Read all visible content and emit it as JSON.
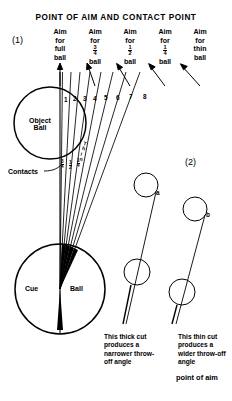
{
  "title": "POINT OF AIM AND CONTACT POINT",
  "figures": {
    "one": "(1)",
    "two": "(2)"
  },
  "aim_columns": [
    {
      "line1": "Aim",
      "line2": "for",
      "line3": "full",
      "num": "",
      "den": "",
      "line4": "ball"
    },
    {
      "line1": "Aim",
      "line2": "for",
      "line3": "",
      "num": "3",
      "den": "4",
      "line4": "ball"
    },
    {
      "line1": "Aim",
      "line2": "for",
      "line3": "",
      "num": "1",
      "den": "2",
      "line4": "ball"
    },
    {
      "line1": "Aim",
      "line2": "for",
      "line3": "",
      "num": "1",
      "den": "4",
      "line4": "ball"
    },
    {
      "line1": "Aim",
      "line2": "for",
      "line3": "thin",
      "num": "",
      "den": "",
      "line4": "ball"
    }
  ],
  "aim_numbers": [
    "1",
    "2",
    "3",
    "4",
    "5",
    "6",
    "7",
    "8"
  ],
  "object_ball": {
    "line1": "Object",
    "line2": "Ball"
  },
  "cue_ball": {
    "left": "Cue",
    "right": "Ball"
  },
  "contacts_label": "Contacts",
  "contact_fractions": [
    {
      "num": "3",
      "den": "4"
    },
    {
      "num": "1",
      "den": "2"
    },
    {
      "num": "1",
      "den": "4"
    }
  ],
  "thin_word": [
    "T",
    "h",
    "i",
    "n"
  ],
  "ball_marks": {
    "a": "a",
    "b": "b"
  },
  "captions": {
    "thick": "This thick cut produces a narrower throw-off angle",
    "thin": "This thin cut produces a wider throw-off angle",
    "point_of_aim": "point of aim"
  },
  "colors": {
    "ink": "#000000",
    "paper": "#ffffff"
  }
}
